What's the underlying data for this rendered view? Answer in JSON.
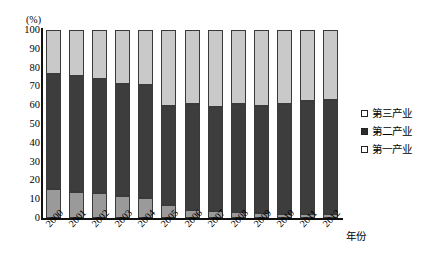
{
  "chart_data": {
    "type": "bar",
    "stacked": true,
    "title": "",
    "subtitle": "",
    "xlabel": "年份",
    "ylabel": "(%)",
    "ylim": [
      0,
      100
    ],
    "yticks": [
      100,
      90,
      80,
      70,
      60,
      50,
      40,
      30,
      20,
      10,
      0
    ],
    "grid": false,
    "legend_position": "right",
    "categories": [
      "2000",
      "2001",
      "2002",
      "2003",
      "2004",
      "2005",
      "2006",
      "2007",
      "2008",
      "2009",
      "2010",
      "2011",
      "2012"
    ],
    "series": [
      {
        "name": "第一产业",
        "color": "#9a9a9a",
        "values": [
          15.5,
          13.8,
          13.5,
          11.8,
          10.4,
          6.8,
          4.5,
          3.6,
          3.0,
          2.6,
          2.4,
          2.3,
          2.2
        ]
      },
      {
        "name": "第二产业",
        "color": "#3d3d3d",
        "values": [
          61.0,
          61.6,
          60.3,
          59.3,
          60.2,
          52.9,
          56.0,
          55.2,
          57.8,
          57.2,
          58.5,
          60.0,
          60.5
        ]
      },
      {
        "name": "第三产业",
        "color": "#c9c9c9",
        "values": [
          23.5,
          24.6,
          26.2,
          28.9,
          29.4,
          40.3,
          39.5,
          41.2,
          39.2,
          40.2,
          39.1,
          37.7,
          37.3
        ]
      }
    ]
  },
  "axis": {
    "unit_label": "(%)",
    "x_title": "年份",
    "tick_labels_y": [
      "100",
      "90",
      "80",
      "70",
      "60",
      "50",
      "40",
      "30",
      "20",
      "10",
      "0"
    ],
    "tick_labels_x": [
      "2000",
      "2001",
      "2002",
      "2003",
      "2004",
      "2005",
      "2006",
      "2007",
      "2008",
      "2009",
      "2010",
      "2011",
      "2012"
    ]
  },
  "legend": {
    "items": [
      {
        "label": "第三产业",
        "key": "tertiary"
      },
      {
        "label": "第二产业",
        "key": "secondary"
      },
      {
        "label": "第一产业",
        "key": "primary"
      }
    ]
  }
}
